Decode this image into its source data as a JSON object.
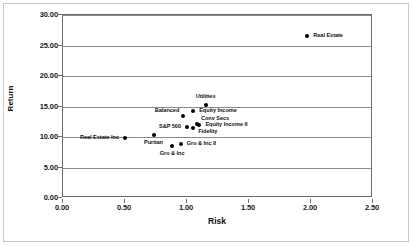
{
  "chart_data": {
    "type": "scatter",
    "title": "",
    "xlabel": "Risk",
    "ylabel": "Return",
    "xlim": [
      0.0,
      2.5
    ],
    "ylim": [
      0.0,
      30.0
    ],
    "xticks": [
      "0.00",
      "0.50",
      "1.00",
      "1.50",
      "2.00",
      "2.50"
    ],
    "xtick_values": [
      0.0,
      0.5,
      1.0,
      1.5,
      2.0,
      2.5
    ],
    "yticks": [
      "0.00",
      "5.00",
      "10.00",
      "15.00",
      "20.00",
      "25.00",
      "30.00"
    ],
    "ytick_values": [
      0.0,
      5.0,
      10.0,
      15.0,
      20.0,
      25.0,
      30.0
    ],
    "grid": "horizontal",
    "legend": "none",
    "marker_color": "#000000",
    "points": [
      {
        "label": "Real Estate",
        "x": 1.97,
        "y": 26.6,
        "label_pos": "right"
      },
      {
        "label": "Utilities",
        "x": 1.15,
        "y": 15.3,
        "label_pos": "above"
      },
      {
        "label": "Equity Income",
        "x": 1.05,
        "y": 14.2,
        "label_pos": "right"
      },
      {
        "label": "Balanced",
        "x": 0.97,
        "y": 13.5,
        "label_pos": "above-left"
      },
      {
        "label": "Conv Secs",
        "x": 1.08,
        "y": 12.2,
        "label_pos": "above-right"
      },
      {
        "label": "Equity Income II",
        "x": 1.1,
        "y": 11.9,
        "label_pos": "right"
      },
      {
        "label": "S&P 500",
        "x": 1.0,
        "y": 11.7,
        "label_pos": "left"
      },
      {
        "label": "Fidelity",
        "x": 1.05,
        "y": 11.4,
        "label_pos": "below-right"
      },
      {
        "label": "Puritan",
        "x": 0.73,
        "y": 10.3,
        "label_pos": "below"
      },
      {
        "label": "Real Estate Inc",
        "x": 0.5,
        "y": 9.9,
        "label_pos": "left"
      },
      {
        "label": "Gro & Inc II",
        "x": 0.95,
        "y": 8.9,
        "label_pos": "right"
      },
      {
        "label": "Gro & Inc",
        "x": 0.88,
        "y": 8.5,
        "label_pos": "below"
      }
    ]
  }
}
